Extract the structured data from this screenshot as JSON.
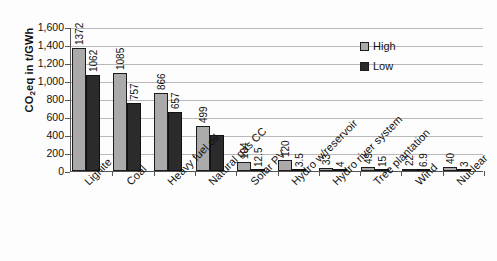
{
  "chart_data": {
    "type": "bar",
    "title": "",
    "xlabel": "",
    "ylabel": "CO2eq in t/GWh",
    "ylabel_parts": {
      "prefix": "CO",
      "sub": "2",
      "suffix": "eq in t/GWh"
    },
    "ylim": [
      0,
      1600
    ],
    "ytick_step": 200,
    "ytick_labels": [
      "1,600",
      "1,400",
      "1,200",
      "1,000",
      "800",
      "600",
      "400",
      "200",
      "0"
    ],
    "ytick_values": [
      1600,
      1400,
      1200,
      1000,
      800,
      600,
      400,
      200,
      0
    ],
    "grid": true,
    "legend_position": "upper right",
    "categories": [
      "Lignite",
      "Coal",
      "Heavy fuel oil",
      "Natural gas CC",
      "Solar PV",
      "Hydro w/reservoir",
      "Hydro river system",
      "Tree plantation",
      "Wind",
      "Nuclear"
    ],
    "series": [
      {
        "name": "High",
        "color": "#aaaaaa",
        "values": [
          1372,
          1085,
          866,
          499,
          104,
          120,
          33,
          49,
          22,
          40
        ],
        "labels": [
          "1372",
          "1085",
          "866",
          "499",
          "104",
          "120",
          "33",
          "49",
          "22",
          "40"
        ]
      },
      {
        "name": "Low",
        "color": "#2b2b2b",
        "values": [
          1062,
          757,
          657,
          400,
          12.5,
          3.5,
          4,
          15,
          6.9,
          3
        ],
        "labels": [
          "1062",
          "757",
          "657",
          "",
          "12.5",
          "3.5",
          "4",
          "15",
          "6.9",
          "3"
        ]
      }
    ]
  },
  "legend": {
    "items": [
      {
        "label": "High",
        "swatch": "high"
      },
      {
        "label": "Low",
        "swatch": "low"
      }
    ]
  }
}
